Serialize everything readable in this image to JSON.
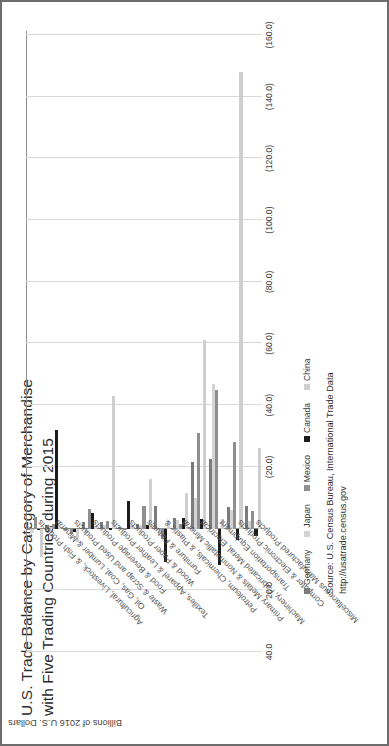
{
  "title": {
    "line1": "U.S. Trade Balance by Category of Merchandise",
    "line2": "with Five Trading Countries during 2015"
  },
  "source": {
    "line1": "Source: U.S. Census Bureau, International Trade Data",
    "line2": "http://usatrade.census.gov"
  },
  "axis": {
    "value_title": "Billions of 2016 U.S. Dollars"
  },
  "legend": {
    "position": "bottom",
    "items": [
      {
        "label": "Germany",
        "color": "#7b7b7b"
      },
      {
        "label": "Japan",
        "color": "#d4d4d4"
      },
      {
        "label": "Mexico",
        "color": "#8f8f8f"
      },
      {
        "label": "Canada",
        "color": "#1c1c1c"
      },
      {
        "label": "China",
        "color": "#cfcfcf"
      }
    ]
  },
  "chart_data": {
    "type": "bar",
    "orientation": "vertical",
    "title": "U.S. Trade Balance by Category of Merchandise with Five Trading Countries during 2015",
    "xlabel": "",
    "ylabel": "Billions of 2016 U.S. Dollars",
    "ylim": [
      -170,
      50
    ],
    "grid": true,
    "ticklabels": [
      "40.0",
      "20.0",
      "-",
      "(20.0)",
      "(40.0)",
      "(60.0)",
      "(80.0)",
      "(100.0)",
      "(120.0)",
      "(140.0)",
      "(160.0)"
    ],
    "tickvalues": [
      40,
      20,
      0,
      -20,
      -40,
      -60,
      -80,
      -100,
      -120,
      -140,
      -160
    ],
    "categories": [
      "Agricultural, Livestock, & Fish Products",
      "Oil, Gas, Coal, Lumber & Mineral",
      "Waste & Scrap and Used Products",
      "Food & Beverage Products",
      "Textiles, Apparel & Leather Products",
      "Wood & Paper Products",
      "Furniture & Fixtures",
      "Petroleum, Chemicals, & Plastic &",
      "Primary Metals & Nonmetallic Mineral",
      "Machinery, Fabricated Metal, Electrical",
      "Transportation Equipment",
      "Computer & Electronic Products",
      "Miscellaneous Manufactured Products"
    ],
    "series": [
      {
        "name": "Germany",
        "color": "#7b7b7b",
        "values": [
          0.6,
          -1.3,
          0.4,
          -2.0,
          -2.3,
          -0.6,
          -1.6,
          -7.2,
          -3.3,
          -21.6,
          -22.5,
          -7.0,
          -7.4
        ]
      },
      {
        "name": "Japan",
        "color": "#d4d4d4",
        "values": [
          1.5,
          -0.3,
          0.5,
          1.3,
          -1.2,
          0.4,
          -1.1,
          1.8,
          -2.9,
          -9.9,
          -47.0,
          -5.9,
          -2.5
        ]
      },
      {
        "name": "Mexico",
        "color": "#8f8f8f",
        "values": [
          -3.8,
          -1.5,
          1.6,
          -6.5,
          -2.4,
          0.3,
          -7.3,
          3.4,
          -1.4,
          -31.0,
          -45.0,
          -28.0,
          -5.6
        ]
      },
      {
        "name": "Canada",
        "color": "#1c1c1c",
        "values": [
          0.5,
          -32.0,
          1.2,
          -5.1,
          0.3,
          -9.1,
          -1.1,
          10.9,
          -3.4,
          -3.0,
          11.9,
          3.6,
          2.5
        ]
      },
      {
        "name": "China",
        "color": "#cfcfcf",
        "values": [
          9.3,
          -1.0,
          4.3,
          -1.0,
          -43.0,
          -1.1,
          -16.0,
          -2.5,
          -11.5,
          -61.0,
          -3.2,
          -148.0,
          -26.0
        ]
      }
    ]
  }
}
